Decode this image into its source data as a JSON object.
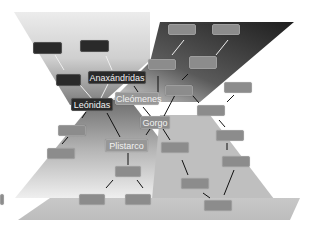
{
  "diagram": {
    "type": "family-tree",
    "labeled_nodes": [
      {
        "id": "anaxandridas",
        "label": "Anaxándridas"
      },
      {
        "id": "leonidas",
        "label": "Leónidas"
      },
      {
        "id": "cleomenes",
        "label": "Cleómenes"
      },
      {
        "id": "gorgo",
        "label": "Gorgo"
      },
      {
        "id": "plistarco",
        "label": "Plistarco"
      }
    ],
    "unlabeled_nodes_count": 21,
    "colors": {
      "dark_node": "#2a2a2a",
      "gray_node": "#8c8c8c",
      "background": "#ffffff",
      "dark_band": "#2b2b2b",
      "light_band": "#c8c8c8"
    }
  }
}
